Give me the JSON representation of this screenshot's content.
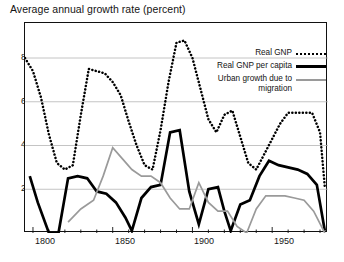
{
  "chart_data": {
    "type": "line",
    "title": "Average annual growth rate (percent)",
    "xlabel": "",
    "ylabel": "",
    "xlim": [
      1795,
      1985
    ],
    "ylim": [
      0,
      9.6
    ],
    "yticks": [
      2,
      4,
      6,
      8
    ],
    "ytick_labels": [
      "2",
      "4",
      "6",
      "8"
    ],
    "xticks": [
      1800,
      1850,
      1900,
      1950
    ],
    "xtick_labels": [
      "1800",
      "1850",
      "1900",
      "1950"
    ],
    "minor_xticks": [
      1810,
      1820,
      1830,
      1840,
      1860,
      1870,
      1880,
      1890,
      1910,
      1920,
      1930,
      1940,
      1960,
      1970,
      1980
    ],
    "grid": "horizontal",
    "legend_position": "upper-right-inside",
    "series": [
      {
        "name": "Real GNP",
        "style": "dotted",
        "color": "#000000",
        "x": [
          1795,
          1800,
          1805,
          1810,
          1815,
          1820,
          1825,
          1830,
          1835,
          1840,
          1845,
          1850,
          1855,
          1860,
          1865,
          1870,
          1875,
          1880,
          1885,
          1890,
          1895,
          1900,
          1905,
          1910,
          1915,
          1920,
          1925,
          1930,
          1935,
          1940,
          1945,
          1950,
          1955,
          1960,
          1965,
          1970,
          1975,
          1980,
          1983
        ],
        "values": [
          8.0,
          7.4,
          6.2,
          4.5,
          3.2,
          2.9,
          3.1,
          5.4,
          7.5,
          7.4,
          7.3,
          6.9,
          6.3,
          5.1,
          4.0,
          3.1,
          2.9,
          4.7,
          6.9,
          8.7,
          8.8,
          8.0,
          6.6,
          5.2,
          4.6,
          5.4,
          5.6,
          4.4,
          3.2,
          2.9,
          3.6,
          4.3,
          5.0,
          5.5,
          5.5,
          5.5,
          5.5,
          4.6,
          2.1
        ]
      },
      {
        "name": "Real GNP per capita",
        "style": "solid-thick",
        "color": "#000000",
        "x": [
          1798,
          1803,
          1810,
          1816,
          1822,
          1828,
          1834,
          1840,
          1846,
          1852,
          1858,
          1862,
          1868,
          1874,
          1880,
          1886,
          1892,
          1898,
          1904,
          1910,
          1916,
          1920,
          1924,
          1930,
          1936,
          1942,
          1948,
          1954,
          1960,
          1966,
          1972,
          1978,
          1983
        ],
        "values": [
          2.6,
          1.4,
          0.0,
          0.0,
          2.5,
          2.6,
          2.5,
          1.9,
          1.8,
          1.4,
          0.7,
          0.1,
          1.6,
          2.1,
          2.2,
          4.6,
          4.7,
          1.9,
          0.4,
          2.0,
          2.1,
          1.0,
          0.1,
          1.3,
          1.5,
          2.6,
          3.3,
          3.1,
          3.0,
          2.9,
          2.7,
          2.2,
          0.1
        ]
      },
      {
        "name": "Urban growth due to migration",
        "style": "solid-thin",
        "color": "#9a9a9a",
        "x": [
          1822,
          1830,
          1838,
          1844,
          1850,
          1856,
          1862,
          1868,
          1874,
          1880,
          1886,
          1892,
          1898,
          1904,
          1910,
          1916,
          1922,
          1928,
          1934,
          1940,
          1946,
          1952,
          1958,
          1964,
          1970,
          1976,
          1983
        ],
        "values": [
          0.5,
          1.1,
          1.5,
          2.6,
          3.9,
          3.4,
          2.9,
          2.6,
          2.6,
          2.3,
          1.6,
          1.1,
          1.1,
          2.3,
          1.4,
          1.0,
          1.0,
          0.3,
          0.0,
          1.1,
          1.7,
          1.7,
          1.7,
          1.6,
          1.5,
          1.0,
          0.0
        ]
      }
    ]
  },
  "title": {
    "text": "Average annual growth rate (percent)"
  },
  "legend": {
    "items": [
      {
        "label": "Real GNP",
        "swatch": "dotted-line-swatch"
      },
      {
        "label": "Real GNP per capita",
        "swatch": "thick-solid-line-swatch"
      },
      {
        "label": "Urban growth due to migration",
        "swatch": "thin-gray-line-swatch"
      }
    ]
  },
  "axes": {
    "y_labels": [
      "8",
      "6",
      "4",
      "2"
    ],
    "x_labels": [
      "1800",
      "1850",
      "1900",
      "1950"
    ]
  }
}
